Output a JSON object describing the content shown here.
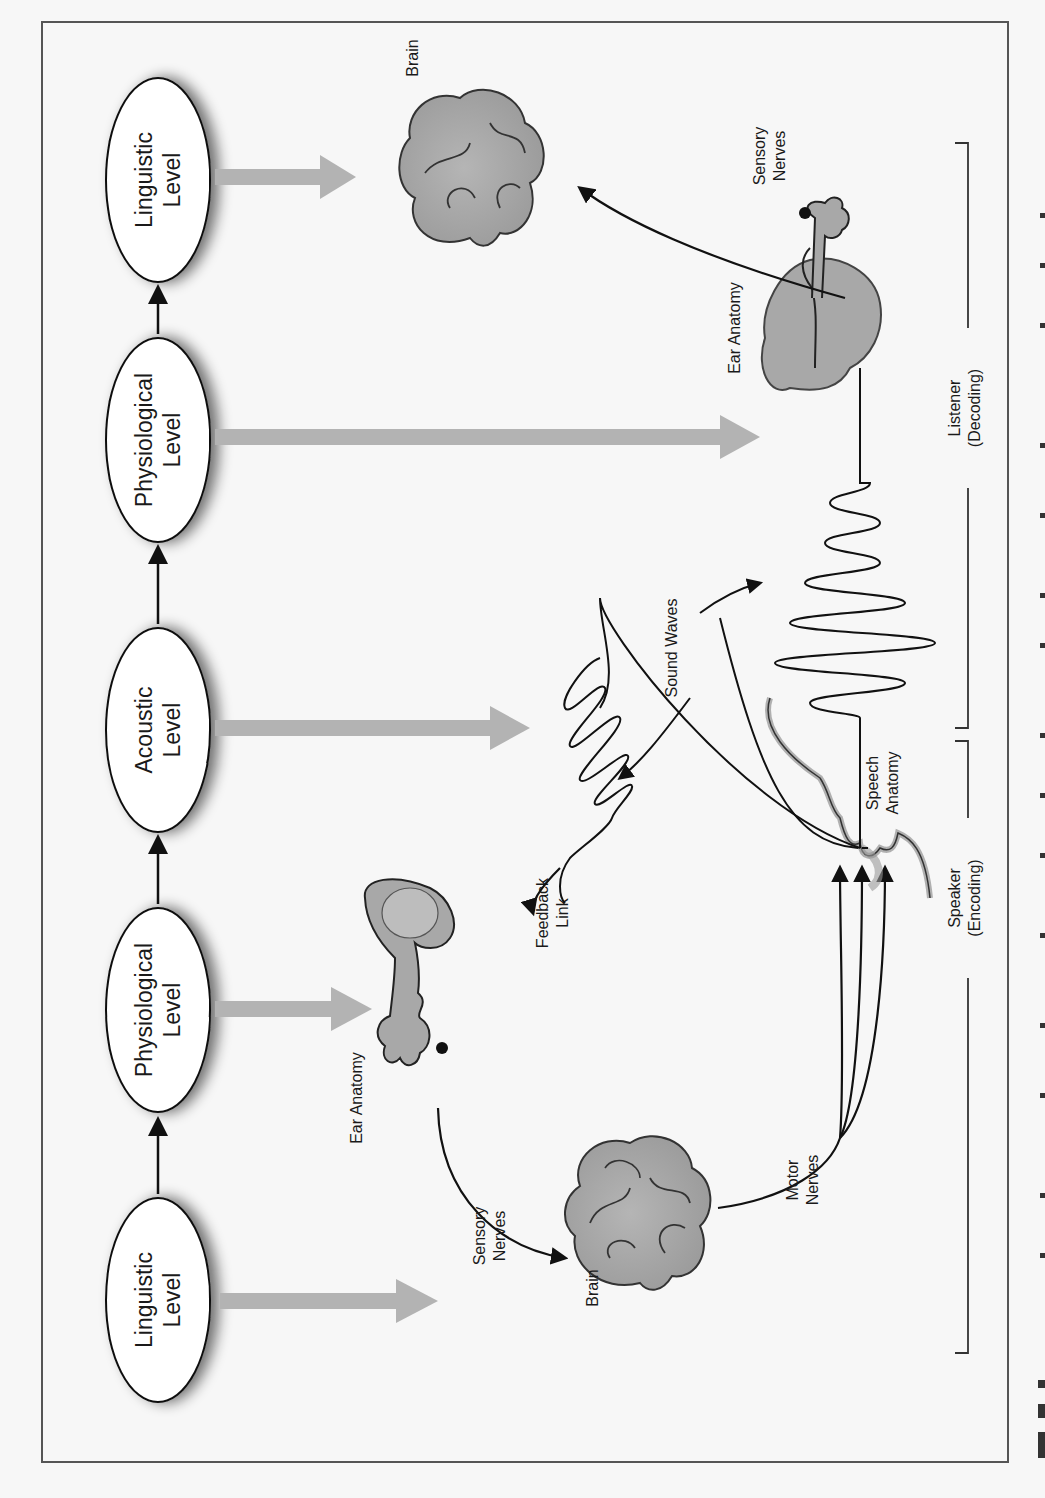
{
  "diagram": {
    "levels": [
      {
        "id": "linguistic-speaker",
        "line1": "Linguistic",
        "line2": "Level"
      },
      {
        "id": "physiological-speaker",
        "line1": "Physiological",
        "line2": "Level"
      },
      {
        "id": "acoustic",
        "line1": "Acoustic",
        "line2": "Level"
      },
      {
        "id": "physiological-listener",
        "line1": "Physiological",
        "line2": "Level"
      },
      {
        "id": "linguistic-listener",
        "line1": "Linguistic",
        "line2": "Level"
      }
    ],
    "speaker_side": {
      "brain": "Brain",
      "sensory_nerves": {
        "line1": "Sensory",
        "line2": "Nerves"
      },
      "motor_nerves": {
        "line1": "Motor",
        "line2": "Nerves"
      },
      "ear_anatomy": "Ear Anatomy",
      "feedback_link": {
        "line1": "Feedback",
        "line2": "Link"
      },
      "speech_anatomy": {
        "line1": "Speech",
        "line2": "Anatomy"
      }
    },
    "middle": {
      "sound_waves": "Sound Waves"
    },
    "listener_side": {
      "ear_anatomy": "Ear Anatomy",
      "sensory_nerves": {
        "line1": "Sensory",
        "line2": "Nerves"
      },
      "brain": "Brain"
    },
    "brackets": {
      "speaker": {
        "line1": "Speaker",
        "line2": "(Encoding)"
      },
      "listener": {
        "line1": "Listener",
        "line2": "(Decoding)"
      }
    },
    "colors": {
      "background": "#f7f7f7",
      "frame": "#555555",
      "oval_fill": "#ffffff",
      "oval_stroke": "#111111",
      "level_arrow": "#b3b3b3",
      "organ_fill": "#a6a6a6",
      "organ_light": "#c8c8c8",
      "line": "#111111"
    }
  }
}
